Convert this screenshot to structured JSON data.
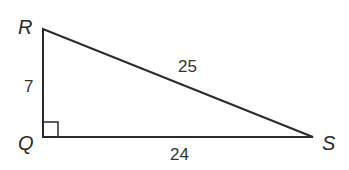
{
  "diagram": {
    "type": "right-triangle",
    "vertices": [
      {
        "name": "R",
        "x": 43,
        "y": 29
      },
      {
        "name": "Q",
        "x": 43,
        "y": 137
      },
      {
        "name": "S",
        "x": 313,
        "y": 137
      }
    ],
    "right_angle_at": "Q",
    "sides": {
      "RQ": "7",
      "QS": "24",
      "RS": "25"
    },
    "labels": {
      "R": "R",
      "Q": "Q",
      "S": "S",
      "side_RQ": "7",
      "side_QS": "24",
      "side_RS": "25"
    },
    "colors": {
      "stroke": "#2a2a2a",
      "background": "#ffffff"
    }
  }
}
